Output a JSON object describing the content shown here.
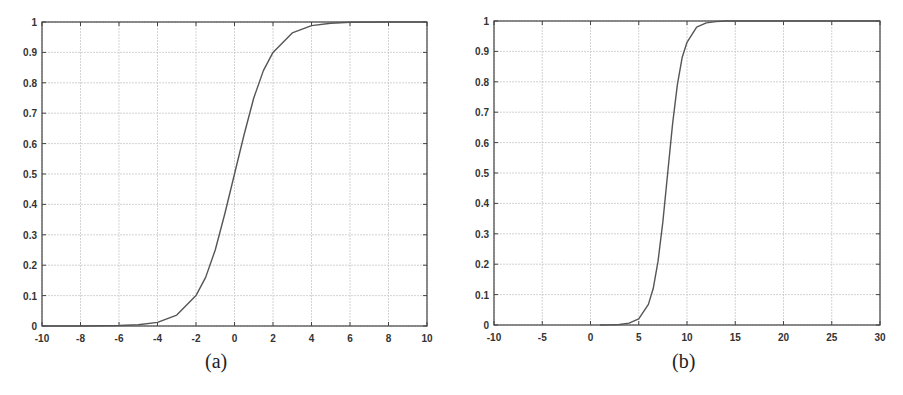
{
  "chart_data": [
    {
      "type": "line",
      "caption": "(a)",
      "title": "",
      "xlabel": "",
      "ylabel": "",
      "xlim": [
        -10,
        10
      ],
      "ylim": [
        0,
        1
      ],
      "grid": true,
      "legend": null,
      "xticks": [
        -10,
        -8,
        -6,
        -4,
        -2,
        0,
        2,
        4,
        6,
        8,
        10
      ],
      "yticks": [
        0,
        0.1,
        0.2,
        0.3,
        0.4,
        0.5,
        0.6,
        0.7,
        0.8,
        0.9,
        1
      ],
      "xtick_labels": [
        "-10",
        "-8",
        "-6",
        "-4",
        "-2",
        "0",
        "2",
        "4",
        "6",
        "8",
        "10"
      ],
      "ytick_labels": [
        "0",
        "0.1",
        "0.2",
        "0.3",
        "0.4",
        "0.5",
        "0.6",
        "0.7",
        "0.8",
        "0.9",
        "1"
      ],
      "series": [
        {
          "name": "sigmoid",
          "color": "#555555",
          "x": [
            -10,
            -8,
            -6,
            -5,
            -4,
            -3,
            -2,
            -1.5,
            -1,
            -0.5,
            0,
            0.5,
            1,
            1.5,
            2,
            3,
            4,
            5,
            6,
            8,
            10
          ],
          "y": [
            0.0,
            0.0002,
            0.0014,
            0.004,
            0.012,
            0.036,
            0.1,
            0.16,
            0.25,
            0.37,
            0.5,
            0.63,
            0.75,
            0.84,
            0.9,
            0.964,
            0.988,
            0.996,
            0.999,
            1.0,
            1.0
          ]
        }
      ]
    },
    {
      "type": "line",
      "caption": "(b)",
      "title": "",
      "xlabel": "",
      "ylabel": "",
      "xlim": [
        -10,
        30
      ],
      "ylim": [
        0,
        1
      ],
      "grid": true,
      "legend": null,
      "xticks": [
        -10,
        -5,
        0,
        5,
        10,
        15,
        20,
        25,
        30
      ],
      "yticks": [
        0,
        0.1,
        0.2,
        0.3,
        0.4,
        0.5,
        0.6,
        0.7,
        0.8,
        0.9,
        1
      ],
      "xtick_labels": [
        "-10",
        "-5",
        "0",
        "5",
        "10",
        "15",
        "20",
        "25",
        "30"
      ],
      "ytick_labels": [
        "0",
        "0.1",
        "0.2",
        "0.3",
        "0.4",
        "0.5",
        "0.6",
        "0.7",
        "0.8",
        "0.9",
        "1"
      ],
      "series": [
        {
          "name": "shifted sigmoid",
          "color": "#555555",
          "x": [
            1,
            2,
            3,
            4,
            5,
            6,
            6.5,
            7,
            7.5,
            8,
            8.5,
            9,
            9.5,
            10,
            11,
            12,
            13,
            14,
            15,
            20,
            30
          ],
          "y": [
            0.0001,
            0.0004,
            0.0015,
            0.006,
            0.02,
            0.068,
            0.12,
            0.21,
            0.34,
            0.5,
            0.66,
            0.79,
            0.88,
            0.93,
            0.98,
            0.994,
            0.998,
            1.0,
            1.0,
            1.0,
            1.0
          ]
        }
      ]
    }
  ]
}
